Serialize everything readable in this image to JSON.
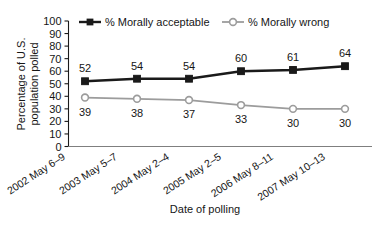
{
  "chart_data": {
    "type": "line",
    "title": "",
    "xlabel": "Date of polling",
    "ylabel": "Percentage of U.S. population polled",
    "ylabel_line1": "Percentage of U.S.",
    "ylabel_line2": "population polled",
    "categories": [
      "2002 May 6–9",
      "2003 May 5–7",
      "2004 May 2–4",
      "2005 May 2–5",
      "2006 May 8–11",
      "2007 May 10–13"
    ],
    "series": [
      {
        "name": "% Morally acceptable",
        "values": [
          52,
          54,
          54,
          60,
          61,
          64
        ],
        "color": "#1a1a1a",
        "marker": "filled-square",
        "label_position": "above"
      },
      {
        "name": "% Morally wrong",
        "values": [
          39,
          38,
          37,
          33,
          30,
          30
        ],
        "color": "#9c9c9c",
        "marker": "open-circle",
        "label_position": "below"
      }
    ],
    "ylim": [
      0,
      100
    ],
    "yticks": [
      0,
      10,
      20,
      30,
      40,
      50,
      60,
      70,
      80,
      90,
      100
    ],
    "ytick_labels": [
      "0",
      "10",
      "20",
      "30",
      "40",
      "50",
      "60",
      "70",
      "80",
      "90",
      "100"
    ],
    "grid": false,
    "legend_position": "top"
  }
}
